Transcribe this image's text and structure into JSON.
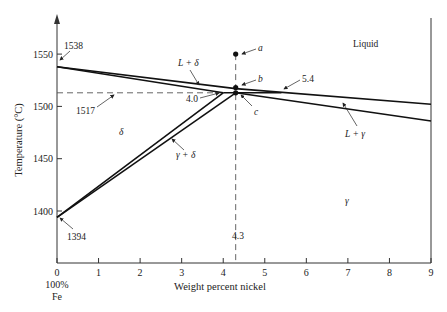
{
  "chart_data": {
    "type": "line",
    "title": "",
    "xlabel": "Weight percent nickel",
    "ylabel": "Temperature (°C)",
    "xlim": [
      0,
      9
    ],
    "ylim": [
      1350,
      1583
    ],
    "x_ticks": [
      0,
      1,
      2,
      3,
      4,
      5,
      6,
      7,
      8,
      9
    ],
    "x_tick_labels": [
      "0",
      "1",
      "2",
      "3",
      "4",
      "5",
      "6",
      "7",
      "8",
      "9"
    ],
    "y_ticks": [
      1400,
      1450,
      1500,
      1550
    ],
    "y_tick_labels": [
      "1400",
      "1450",
      "1500",
      "1550"
    ],
    "x_origin_sublabel": [
      "100%",
      "Fe"
    ],
    "grid": false,
    "legend": "none",
    "series": [
      {
        "name": "liquidus (L/L+δ, L/L+γ)",
        "points": [
          [
            0,
            1538
          ],
          [
            4.3,
            1517
          ],
          [
            9,
            1502
          ]
        ]
      },
      {
        "name": "δ solidus",
        "points": [
          [
            0,
            1538
          ],
          [
            4.0,
            1513
          ]
        ]
      },
      {
        "name": "peritectic line",
        "points": [
          [
            4.0,
            1513
          ],
          [
            4.3,
            1513
          ],
          [
            5.4,
            1513
          ]
        ]
      },
      {
        "name": "γ solidus",
        "points": [
          [
            4.3,
            1513
          ],
          [
            9,
            1486
          ]
        ]
      },
      {
        "name": "δ/γ+δ boundary",
        "points": [
          [
            0,
            1394
          ],
          [
            4.0,
            1513
          ]
        ]
      },
      {
        "name": "γ+δ/γ boundary",
        "points": [
          [
            0,
            1394
          ],
          [
            4.3,
            1513
          ]
        ]
      }
    ],
    "reference_lines": [
      {
        "type": "horizontal-dashed",
        "y": 1513,
        "x_range": [
          0,
          4.0
        ]
      },
      {
        "type": "vertical-dashed",
        "x": 4.3,
        "y_range": [
          1350,
          1550
        ]
      }
    ],
    "points": [
      {
        "label": "a",
        "x": 4.3,
        "y": 1550
      },
      {
        "label": "b",
        "x": 4.3,
        "y": 1518
      },
      {
        "label": "c",
        "x": 4.3,
        "y": 1513
      }
    ],
    "annotations": {
      "t1538": "1538",
      "t1517": "1517",
      "t1394": "1394",
      "c40": "4.0",
      "c54": "5.4",
      "c43": "4.3",
      "region_liquid": "Liquid",
      "region_l_delta": "L + δ",
      "region_l_gamma": "L + γ",
      "region_delta": "δ",
      "region_gamma_delta": "γ + δ",
      "region_gamma": "γ",
      "pt_a": "a",
      "pt_b": "b",
      "pt_c": "c"
    }
  }
}
